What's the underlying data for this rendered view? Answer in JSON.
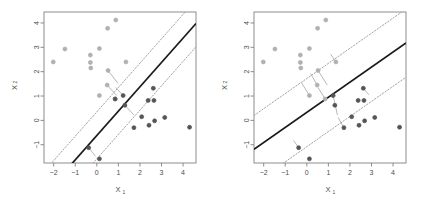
{
  "figure": {
    "title": "",
    "background": "#ffffff",
    "panel_count": 2
  },
  "axes": {
    "xlabel": "X",
    "xlabel_sub": "1",
    "ylabel": "X",
    "ylabel_sub": "2",
    "xticks": [
      "-2",
      "-1",
      "0",
      "1",
      "2",
      "3",
      "4"
    ],
    "yticks": [
      "-1",
      "0",
      "1",
      "2",
      "3",
      "4"
    ],
    "xlim": [
      -2.45,
      4.6
    ],
    "ylim": [
      -1.75,
      4.45
    ],
    "box_color": "#808080",
    "tick_color": "#808080",
    "label_color": "#4d4d4d"
  },
  "style": {
    "class_low_color": "#555555",
    "class_high_color": "#b0b0b0",
    "hyperplane_color": "#1a1a1a",
    "margin_color": "#999999",
    "slack_color": "#aaaaaa",
    "point_radius": 2.0
  },
  "chart_data": [
    {
      "type": "scatter",
      "panel": "left",
      "title": "",
      "xlabel": "X1",
      "ylabel": "X2",
      "xlim": [
        -2.45,
        4.6
      ],
      "ylim": [
        -1.75,
        4.45
      ],
      "grid": false,
      "legend": "none",
      "series": [
        {
          "name": "class_high",
          "color": "#b0b0b0",
          "points": [
            [
              -2.02,
              2.4
            ],
            [
              -1.48,
              2.93
            ],
            [
              -0.3,
              2.68
            ],
            [
              -0.3,
              2.38
            ],
            [
              -0.28,
              2.15
            ],
            [
              0.12,
              2.95
            ],
            [
              0.12,
              1.02
            ],
            [
              0.5,
              3.78
            ],
            [
              0.52,
              2.05
            ],
            [
              0.88,
              4.12
            ],
            [
              0.85,
              0.88
            ],
            [
              1.35,
              2.4
            ],
            [
              0.48,
              1.45
            ]
          ]
        },
        {
          "name": "class_low",
          "color": "#555555",
          "points": [
            [
              -0.38,
              -1.12
            ],
            [
              0.12,
              -1.58
            ],
            [
              0.85,
              0.88
            ],
            [
              1.22,
              1.02
            ],
            [
              1.3,
              0.62
            ],
            [
              1.72,
              -0.3
            ],
            [
              2.08,
              0.15
            ],
            [
              2.38,
              0.82
            ],
            [
              2.42,
              -0.2
            ],
            [
              2.62,
              1.32
            ],
            [
              2.65,
              0.82
            ],
            [
              2.68,
              -0.02
            ],
            [
              3.15,
              0.12
            ],
            [
              4.3,
              -0.28
            ]
          ]
        }
      ],
      "hyperplane": {
        "slope": 1.0,
        "intercept": -0.62
      },
      "margin_upper": {
        "slope": 1.0,
        "intercept": 0.35
      },
      "margin_lower": {
        "slope": 1.0,
        "intercept": -1.58
      },
      "slack_segments": [
        [
          0.52,
          2.05,
          0.98,
          1.52
        ],
        [
          0.48,
          1.45,
          0.92,
          1.02
        ],
        [
          1.22,
          1.02,
          0.88,
          1.35
        ],
        [
          1.3,
          0.62,
          1.72,
          0.22
        ],
        [
          -0.38,
          -1.12,
          -0.05,
          -1.48
        ]
      ]
    },
    {
      "type": "scatter",
      "panel": "right",
      "title": "",
      "xlabel": "X1",
      "ylabel": "X2",
      "xlim": [
        -2.45,
        4.6
      ],
      "ylim": [
        -1.75,
        4.45
      ],
      "grid": false,
      "legend": "none",
      "series": [
        {
          "name": "class_high",
          "color": "#b0b0b0",
          "points": [
            [
              -2.02,
              2.4
            ],
            [
              -1.48,
              2.93
            ],
            [
              -0.3,
              2.68
            ],
            [
              -0.3,
              2.38
            ],
            [
              -0.28,
              2.15
            ],
            [
              0.12,
              2.95
            ],
            [
              0.12,
              1.02
            ],
            [
              0.5,
              3.78
            ],
            [
              0.52,
              2.05
            ],
            [
              0.88,
              4.12
            ],
            [
              0.85,
              0.88
            ],
            [
              1.35,
              2.4
            ],
            [
              0.48,
              1.45
            ]
          ]
        },
        {
          "name": "class_low",
          "color": "#555555",
          "points": [
            [
              -0.38,
              -1.12
            ],
            [
              0.12,
              -1.58
            ],
            [
              1.22,
              1.02
            ],
            [
              1.3,
              0.62
            ],
            [
              1.72,
              -0.3
            ],
            [
              2.08,
              0.15
            ],
            [
              2.38,
              0.82
            ],
            [
              2.42,
              -0.2
            ],
            [
              2.62,
              1.32
            ],
            [
              2.65,
              0.82
            ],
            [
              2.68,
              -0.02
            ],
            [
              3.15,
              0.12
            ],
            [
              4.3,
              -0.28
            ]
          ]
        }
      ],
      "hyperplane": {
        "slope": 0.62,
        "intercept": 0.33
      },
      "margin_upper": {
        "slope": 0.62,
        "intercept": 1.72
      },
      "margin_lower": {
        "slope": 0.62,
        "intercept": -1.08
      },
      "slack_segments": [
        [
          0.12,
          1.02,
          -0.25,
          1.55
        ],
        [
          0.48,
          1.45,
          0.18,
          1.92
        ],
        [
          0.52,
          2.05,
          0.95,
          1.45
        ],
        [
          0.85,
          0.88,
          0.52,
          1.35
        ],
        [
          1.35,
          2.4,
          1.1,
          2.72
        ],
        [
          1.22,
          1.02,
          1.42,
          0.22
        ],
        [
          1.72,
          -0.3,
          1.45,
          0.12
        ],
        [
          2.62,
          1.32,
          2.88,
          1.05
        ],
        [
          -0.38,
          -1.12,
          -0.62,
          -0.82
        ]
      ]
    }
  ]
}
